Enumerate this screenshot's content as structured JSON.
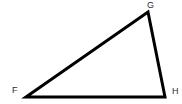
{
  "figure": {
    "kind": "geometry-triangle-diagram",
    "name": "Triangle FGH",
    "width": 182,
    "height": 104,
    "background_color": "#ffffff",
    "stroke_color": "#000000",
    "stroke_width": 3,
    "label_color": "#2b2b2b",
    "label_font_size": 9
  },
  "vertices": [
    {
      "id": "F",
      "label": "F",
      "x": 26,
      "y": 97,
      "label_x": 12,
      "label_y": 86
    },
    {
      "id": "G",
      "label": "G",
      "x": 148,
      "y": 12,
      "label_x": 147,
      "label_y": 1
    },
    {
      "id": "H",
      "label": "H",
      "x": 165,
      "y": 97,
      "label_x": 172,
      "label_y": 87
    }
  ],
  "edges": [
    {
      "id": "FG",
      "from": "F",
      "to": "G"
    },
    {
      "id": "GH",
      "from": "G",
      "to": "H"
    },
    {
      "id": "HF",
      "from": "H",
      "to": "F"
    }
  ],
  "path": {
    "points": "26,97 148,12 165,97",
    "closed": true
  }
}
